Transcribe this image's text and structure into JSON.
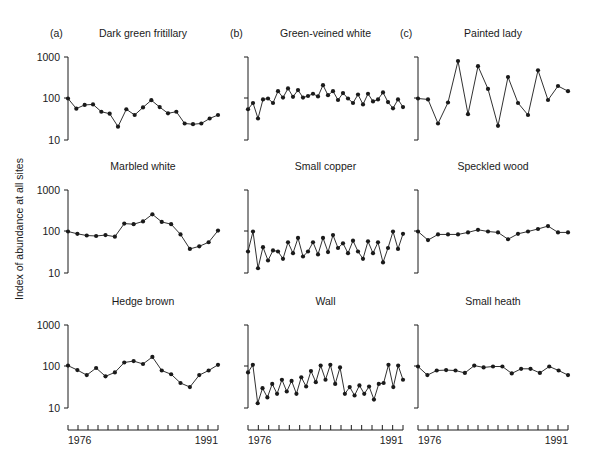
{
  "figure": {
    "ylabel": "Index of abundance at all sites",
    "xlabel_start": "1976",
    "xlabel_end": "1991",
    "ytick_labels": [
      "1000",
      "100",
      "10"
    ],
    "ytick_values": [
      1000,
      100,
      10
    ],
    "column_letters": [
      "(a)",
      "(b)",
      "(c)"
    ]
  },
  "chart_data": [
    {
      "type": "line",
      "title": "Dark green fritillary",
      "panel": "(a)",
      "row": 1,
      "col": 1,
      "xlabel": "",
      "ylabel": "Index of abundance at all sites",
      "yscale": "log",
      "ylim": [
        10,
        1000
      ],
      "grid": false,
      "axis_labeled": true,
      "x": [
        1976,
        1977,
        1978,
        1979,
        1980,
        1981,
        1982,
        1983,
        1984,
        1985,
        1986,
        1987,
        1988,
        1989,
        1990,
        1991
      ],
      "values": [
        100,
        57,
        70,
        72,
        48,
        43,
        21,
        55,
        40,
        61,
        91,
        62,
        44,
        48,
        25,
        24,
        25,
        33,
        40
      ]
    },
    {
      "type": "line",
      "title": "Green-veined white",
      "panel": "(b)",
      "row": 1,
      "col": 2,
      "xlabel": "",
      "ylabel": "",
      "yscale": "log",
      "ylim": [
        10,
        1000
      ],
      "grid": false,
      "axis_labeled": false,
      "x": [
        1976,
        1976.5,
        1977,
        1977.5,
        1978,
        1978.5,
        1979,
        1979.5,
        1980,
        1980.5,
        1981,
        1981.5,
        1982,
        1982.5,
        1983,
        1983.5,
        1984,
        1984.5,
        1985,
        1985.5,
        1986,
        1986.5,
        1987,
        1987.5,
        1988,
        1988.5,
        1989,
        1989.5,
        1990,
        1990.5,
        1991,
        1991.5
      ],
      "values": [
        55,
        78,
        33,
        95,
        100,
        78,
        150,
        105,
        175,
        110,
        160,
        105,
        115,
        130,
        112,
        210,
        120,
        150,
        92,
        135,
        100,
        78,
        125,
        72,
        130,
        85,
        95,
        140,
        82,
        58,
        95,
        62
      ]
    },
    {
      "type": "line",
      "title": "Painted lady",
      "panel": "(c)",
      "row": 1,
      "col": 3,
      "xlabel": "",
      "ylabel": "",
      "yscale": "log",
      "ylim": [
        10,
        1000
      ],
      "grid": false,
      "axis_labeled": false,
      "x": [
        1976,
        1977,
        1978,
        1979,
        1980,
        1981,
        1982,
        1983,
        1984,
        1985,
        1986,
        1987,
        1988,
        1989,
        1990,
        1991
      ],
      "values": [
        100,
        95,
        25,
        80,
        800,
        42,
        600,
        170,
        22,
        330,
        78,
        40,
        480,
        92,
        200,
        150
      ]
    },
    {
      "type": "line",
      "title": "Marbled white",
      "panel": "",
      "row": 2,
      "col": 1,
      "xlabel": "",
      "ylabel": "Index of abundance at all sites",
      "yscale": "log",
      "ylim": [
        10,
        1000
      ],
      "grid": false,
      "axis_labeled": true,
      "x": [
        1976,
        1977,
        1978,
        1979,
        1980,
        1981,
        1982,
        1983,
        1984,
        1985,
        1986,
        1987,
        1988,
        1989,
        1990,
        1991
      ],
      "values": [
        100,
        88,
        80,
        78,
        82,
        75,
        155,
        150,
        175,
        260,
        170,
        150,
        85,
        38,
        44,
        55,
        105
      ]
    },
    {
      "type": "line",
      "title": "Small copper",
      "panel": "",
      "row": 2,
      "col": 2,
      "xlabel": "",
      "ylabel": "",
      "yscale": "log",
      "ylim": [
        10,
        1000
      ],
      "grid": false,
      "axis_labeled": false,
      "x": [
        1976,
        1976.5,
        1977,
        1977.5,
        1978,
        1978.5,
        1979,
        1979.5,
        1980,
        1980.5,
        1981,
        1981.5,
        1982,
        1982.5,
        1983,
        1983.5,
        1984,
        1984.5,
        1985,
        1985.5,
        1986,
        1986.5,
        1987,
        1987.5,
        1988,
        1988.5,
        1989,
        1989.5,
        1990,
        1990.5,
        1991,
        1991.5
      ],
      "values": [
        33,
        100,
        13,
        42,
        20,
        35,
        33,
        22,
        55,
        30,
        70,
        25,
        33,
        55,
        28,
        70,
        32,
        82,
        40,
        52,
        30,
        60,
        33,
        22,
        58,
        30,
        55,
        18,
        40,
        100,
        38,
        88
      ]
    },
    {
      "type": "line",
      "title": "Speckled wood",
      "panel": "",
      "row": 2,
      "col": 3,
      "xlabel": "",
      "ylabel": "",
      "yscale": "log",
      "ylim": [
        10,
        1000
      ],
      "grid": false,
      "axis_labeled": false,
      "x": [
        1976,
        1977,
        1978,
        1979,
        1980,
        1981,
        1982,
        1983,
        1984,
        1985,
        1986,
        1987,
        1988,
        1989,
        1990,
        1991
      ],
      "values": [
        100,
        62,
        85,
        85,
        85,
        95,
        110,
        100,
        95,
        65,
        88,
        100,
        115,
        135,
        95,
        95
      ]
    },
    {
      "type": "line",
      "title": "Hedge brown",
      "panel": "",
      "row": 3,
      "col": 1,
      "xlabel": "",
      "ylabel": "Index of abundance at all sites",
      "yscale": "log",
      "ylim": [
        10,
        1000
      ],
      "grid": false,
      "axis_labeled": true,
      "x": [
        1976,
        1977,
        1978,
        1979,
        1980,
        1981,
        1982,
        1983,
        1984,
        1985,
        1986,
        1987,
        1988,
        1989,
        1990,
        1991
      ],
      "values": [
        105,
        82,
        62,
        92,
        58,
        72,
        125,
        135,
        115,
        170,
        80,
        65,
        40,
        32,
        62,
        80,
        110
      ]
    },
    {
      "type": "line",
      "title": "Wall",
      "panel": "",
      "row": 3,
      "col": 2,
      "xlabel": "",
      "ylabel": "",
      "yscale": "log",
      "ylim": [
        10,
        1000
      ],
      "grid": false,
      "axis_labeled": false,
      "x": [
        1976,
        1976.5,
        1977,
        1977.5,
        1978,
        1978.5,
        1979,
        1979.5,
        1980,
        1980.5,
        1981,
        1981.5,
        1982,
        1982.5,
        1983,
        1983.5,
        1984,
        1984.5,
        1985,
        1985.5,
        1986,
        1986.5,
        1987,
        1987.5,
        1988,
        1988.5,
        1989,
        1989.5,
        1990,
        1990.5,
        1991,
        1991.5
      ],
      "values": [
        72,
        110,
        13,
        30,
        18,
        38,
        22,
        48,
        25,
        45,
        22,
        55,
        33,
        78,
        42,
        105,
        48,
        110,
        38,
        95,
        22,
        32,
        20,
        35,
        22,
        33,
        16,
        38,
        40,
        110,
        32,
        105,
        48
      ]
    },
    {
      "type": "line",
      "title": "Small heath",
      "panel": "",
      "row": 3,
      "col": 3,
      "xlabel": "",
      "ylabel": "",
      "yscale": "log",
      "ylim": [
        10,
        1000
      ],
      "grid": false,
      "axis_labeled": false,
      "x": [
        1976,
        1977,
        1978,
        1979,
        1980,
        1981,
        1982,
        1983,
        1984,
        1985,
        1986,
        1987,
        1988,
        1989,
        1990,
        1991
      ],
      "values": [
        100,
        62,
        80,
        82,
        80,
        70,
        105,
        95,
        100,
        100,
        68,
        88,
        88,
        70,
        100,
        80,
        62
      ]
    }
  ]
}
